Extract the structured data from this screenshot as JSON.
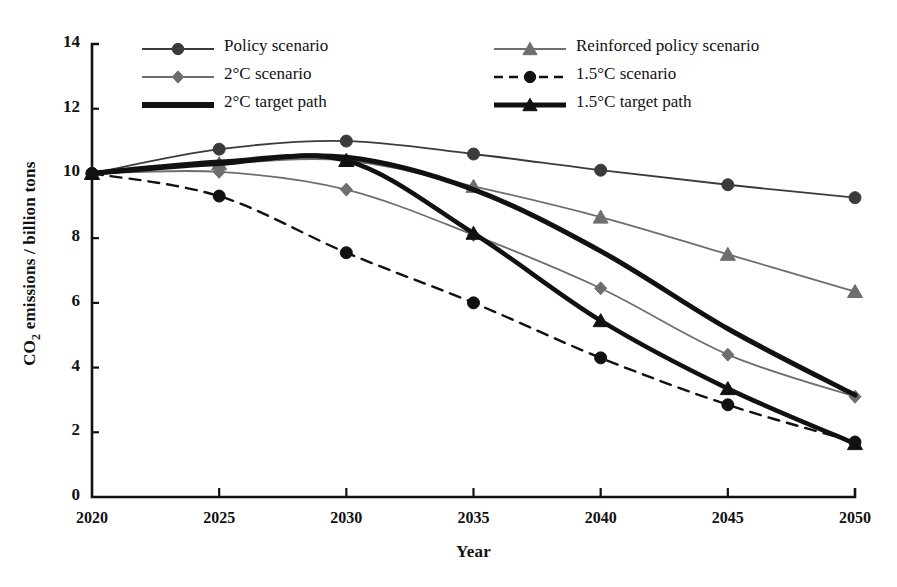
{
  "chart_data": {
    "type": "line",
    "title": "",
    "xlabel": "Year",
    "ylabel": "CO2 emissions / billion tons",
    "ylabel_html": "CO<sub>2</sub> emissions / billion tons",
    "categories": [
      2020,
      2025,
      2030,
      2035,
      2040,
      2045,
      2050
    ],
    "xticks": [
      "2020",
      "2025",
      "2030",
      "2035",
      "2040",
      "2045",
      "2050"
    ],
    "yticks": [
      "0",
      "2",
      "4",
      "6",
      "8",
      "10",
      "12",
      "14"
    ],
    "xlim": [
      2020,
      2050
    ],
    "ylim": [
      0,
      14
    ],
    "grid": false,
    "legend_position": "top-inside-two-columns",
    "series": [
      {
        "name": "Policy scenario",
        "values": [
          10.0,
          10.75,
          11.0,
          10.6,
          10.1,
          9.65,
          9.25
        ],
        "marker": "circle",
        "dash": "solid",
        "color": "#3b3b3b",
        "width": 1.8
      },
      {
        "name": "Reinforced policy scenario",
        "values": [
          10.0,
          10.3,
          10.4,
          9.6,
          8.65,
          7.5,
          6.35
        ],
        "marker": "triangle",
        "dash": "solid",
        "color": "#6e6e6e",
        "width": 1.8
      },
      {
        "name": "2°C scenario",
        "values": [
          10.0,
          10.05,
          9.5,
          8.1,
          6.45,
          4.4,
          3.1
        ],
        "marker": "diamond",
        "dash": "solid",
        "color": "#6e6e6e",
        "width": 1.8
      },
      {
        "name": "1.5°C scenario",
        "values": [
          10.0,
          9.3,
          7.55,
          6.0,
          4.3,
          2.85,
          1.7
        ],
        "marker": "circle",
        "dash": "dashed",
        "color": "#111111",
        "width": 2.4
      },
      {
        "name": "2°C target path",
        "values": [
          10.0,
          10.35,
          10.5,
          9.5,
          7.6,
          5.2,
          3.15
        ],
        "marker": "none",
        "dash": "solid",
        "color": "#111111",
        "width": 5.0
      },
      {
        "name": "1.5°C target path",
        "values": [
          10.0,
          10.3,
          10.4,
          8.15,
          5.45,
          3.35,
          1.65
        ],
        "marker": "triangle",
        "dash": "solid",
        "color": "#111111",
        "width": 4.6
      }
    ]
  },
  "legend": {
    "items": [
      {
        "label": "Policy scenario",
        "marker": "circle",
        "dash": "solid",
        "color": "#3b3b3b",
        "width": 2.0,
        "col": 0,
        "row": 0
      },
      {
        "label": "2°C scenario",
        "marker": "diamond",
        "dash": "solid",
        "color": "#6e6e6e",
        "width": 2.0,
        "col": 0,
        "row": 1
      },
      {
        "label": "2°C target path",
        "marker": "none",
        "dash": "solid",
        "color": "#111111",
        "width": 6.0,
        "col": 0,
        "row": 2
      },
      {
        "label": "Reinforced policy scenario",
        "marker": "triangle",
        "dash": "solid",
        "color": "#6e6e6e",
        "width": 2.0,
        "col": 1,
        "row": 0
      },
      {
        "label": "1.5°C scenario",
        "marker": "circle",
        "dash": "dashed",
        "color": "#111111",
        "width": 2.6,
        "col": 1,
        "row": 1
      },
      {
        "label": "1.5°C target path",
        "marker": "triangle",
        "dash": "solid",
        "color": "#111111",
        "width": 5.0,
        "col": 1,
        "row": 2
      }
    ]
  },
  "axes": {
    "x_title": "Year",
    "y_title_main": "CO",
    "y_title_sub": "2",
    "y_title_rest": " emissions / billion tons"
  }
}
